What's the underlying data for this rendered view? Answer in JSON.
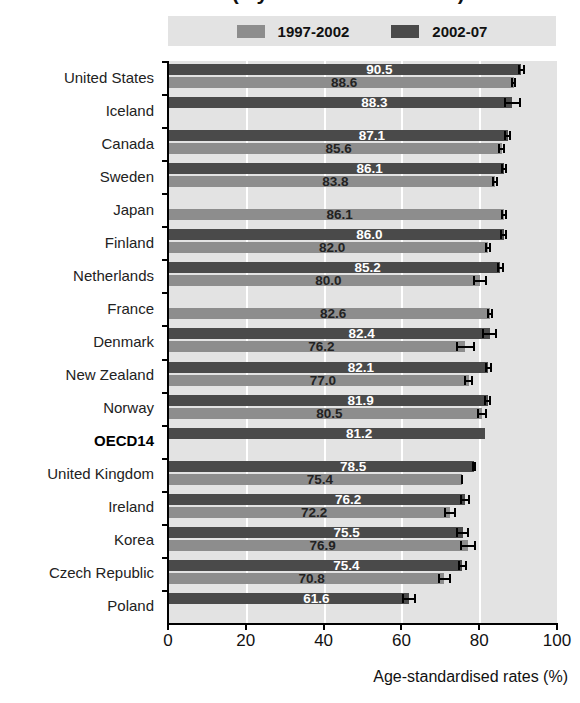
{
  "title": {
    "text": "1997-2002 and 2002-07 (5-year relative survival)",
    "clipped": true
  },
  "legend": {
    "items": [
      {
        "label": "1997-2002",
        "color": "#8d8d8d",
        "swatch": "light-gray-swatch"
      },
      {
        "label": "2002-07",
        "color": "#4a4a4a",
        "swatch": "dark-gray-swatch"
      }
    ]
  },
  "axis": {
    "x_title": "Age-standardised rates (%)",
    "x_ticks": [
      "0",
      "20",
      "40",
      "60",
      "80",
      "100"
    ]
  },
  "chart_data": {
    "type": "bar",
    "orientation": "horizontal",
    "title": "1997-2002 and 2002-07 (5-year relative survival)",
    "xlabel": "Age-standardised rates (%)",
    "ylabel": "",
    "xlim": [
      0,
      100
    ],
    "xticks": [
      0,
      20,
      40,
      60,
      80,
      100
    ],
    "grid": "vertical",
    "legend_position": "top",
    "categories": [
      "United States",
      "Iceland",
      "Canada",
      "Sweden",
      "Japan",
      "Finland",
      "Netherlands",
      "France",
      "Denmark",
      "New Zealand",
      "Norway",
      "OECD14",
      "United Kingdom",
      "Ireland",
      "Korea",
      "Czech Republic",
      "Poland"
    ],
    "series": [
      {
        "name": "2002-07",
        "color": "#4a4a4a",
        "values": [
          90.5,
          88.3,
          87.1,
          86.1,
          null,
          86.0,
          85.2,
          null,
          82.4,
          82.1,
          81.9,
          81.2,
          78.5,
          76.2,
          75.5,
          75.4,
          61.6
        ],
        "err_low": [
          89.6,
          86.0,
          86.2,
          85.3,
          null,
          85.2,
          84.4,
          null,
          80.5,
          81.2,
          81.1,
          null,
          78.0,
          74.9,
          73.8,
          74.4,
          59.8
        ],
        "err_high": [
          91.4,
          90.6,
          88.0,
          87.0,
          null,
          86.8,
          86.1,
          null,
          84.3,
          83.0,
          82.8,
          null,
          79.0,
          77.5,
          77.2,
          76.5,
          63.4
        ]
      },
      {
        "name": "1997-2002",
        "color": "#8d8d8d",
        "values": [
          88.6,
          null,
          85.6,
          83.8,
          86.1,
          82.0,
          80.0,
          82.6,
          76.2,
          77.0,
          80.5,
          null,
          75.4,
          72.2,
          76.9,
          70.8,
          null
        ],
        "err_low": [
          88.0,
          null,
          84.7,
          83.1,
          85.3,
          81.2,
          78.2,
          81.8,
          73.8,
          75.9,
          79.2,
          null,
          75.1,
          70.6,
          74.9,
          69.2,
          null
        ],
        "err_high": [
          89.2,
          null,
          86.5,
          84.5,
          86.9,
          82.8,
          81.8,
          83.4,
          78.6,
          78.1,
          81.8,
          null,
          75.7,
          73.8,
          78.9,
          72.4,
          null
        ]
      }
    ],
    "bold_category": "OECD14"
  },
  "labels": {
    "values": {
      "United States": {
        "dark": "90.5",
        "light": "88.6"
      },
      "Iceland": {
        "dark": "88.3",
        "light": null
      },
      "Canada": {
        "dark": "87.1",
        "light": "85.6"
      },
      "Sweden": {
        "dark": "86.1",
        "light": "83.8"
      },
      "Japan": {
        "dark": null,
        "light": "86.1"
      },
      "Finland": {
        "dark": "86.0",
        "light": "82.0"
      },
      "Netherlands": {
        "dark": "85.2",
        "light": "80.0"
      },
      "France": {
        "dark": null,
        "light": "82.6"
      },
      "Denmark": {
        "dark": "82.4",
        "light": "76.2"
      },
      "New Zealand": {
        "dark": "82.1",
        "light": "77.0"
      },
      "Norway": {
        "dark": "81.9",
        "light": "80.5"
      },
      "OECD14": {
        "dark": "81.2",
        "light": null
      },
      "United Kingdom": {
        "dark": "78.5",
        "light": "75.4"
      },
      "Ireland": {
        "dark": "76.2",
        "light": "72.2"
      },
      "Korea": {
        "dark": "75.5",
        "light": "76.9"
      },
      "Czech Republic": {
        "dark": "75.4",
        "light": "70.8"
      },
      "Poland": {
        "dark": "61.6",
        "light": null
      }
    }
  },
  "colors": {
    "dark_bar": "#4a4a4a",
    "light_bar": "#8d8d8d",
    "plot_background": "#e3e3e3",
    "gridline": "#ffffff",
    "axis": "#000000"
  }
}
